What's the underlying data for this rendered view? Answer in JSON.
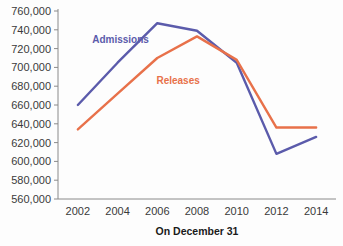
{
  "chart_data": {
    "type": "line",
    "title": "",
    "xlabel": "On December 31",
    "ylabel": "",
    "categories": [
      2002,
      2004,
      2006,
      2008,
      2010,
      2012,
      2014
    ],
    "xlim": [
      2001,
      2015
    ],
    "ylim": [
      560000,
      760000
    ],
    "grid": false,
    "legend_position": "inline-annotation",
    "ytick_labels": [
      "560,000",
      "580,000",
      "600,000",
      "620,000",
      "640,000",
      "660,000",
      "680,000",
      "700,000",
      "720,000",
      "740,000",
      "760,000"
    ],
    "ytick_values": [
      560000,
      580000,
      600000,
      620000,
      640000,
      660000,
      680000,
      700000,
      720000,
      740000,
      760000
    ],
    "xtick_labels": [
      "2002",
      "2004",
      "2006",
      "2008",
      "2010",
      "2012",
      "2014"
    ],
    "series": [
      {
        "name": "Admissions",
        "color": "#5b5bab",
        "values": [
          660000,
          705000,
          747000,
          739000,
          705000,
          608000,
          626000
        ],
        "label_x": 2004.15,
        "label_y": 726000
      },
      {
        "name": "Releases",
        "color": "#e8714a",
        "values": [
          634000,
          672000,
          710000,
          733000,
          708000,
          636000,
          636000
        ],
        "label_x": 2007.05,
        "label_y": 682000
      }
    ]
  }
}
